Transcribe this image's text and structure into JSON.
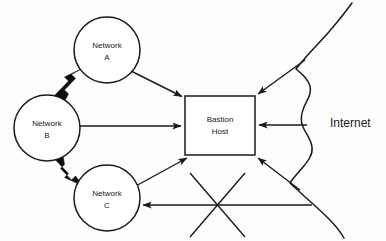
{
  "diagram": {
    "background_color": "#fdfdfd",
    "line_color": "#1a1a1a",
    "nodes": [
      {
        "id": "network-a",
        "label_line1": "Network",
        "label_line2": "A",
        "shape": "circle",
        "cx": 107,
        "cy": 50,
        "r": 33
      },
      {
        "id": "network-b",
        "label_line1": "Network",
        "label_line2": "B",
        "shape": "circle",
        "cx": 47,
        "cy": 128,
        "r": 33
      },
      {
        "id": "network-c",
        "label_line1": "Network",
        "label_line2": "C",
        "shape": "circle",
        "cx": 107,
        "cy": 198,
        "r": 33
      },
      {
        "id": "bastion-host",
        "label_line1": "Bastion",
        "label_line2": "Host",
        "shape": "rect",
        "x": 185,
        "y": 96,
        "w": 70,
        "h": 59
      }
    ],
    "cloud": {
      "id": "internet",
      "label": "Internet",
      "label_x": 330,
      "label_y": 124
    },
    "connections": [
      {
        "id": "a-to-bastion",
        "from": "network-a",
        "to": "bastion-host",
        "style": "thin-arrow",
        "direction": "one-way"
      },
      {
        "id": "b-to-bastion",
        "from": "network-b",
        "to": "bastion-host",
        "style": "thin-arrow",
        "direction": "one-way"
      },
      {
        "id": "c-to-bastion",
        "from": "network-c",
        "to": "bastion-host",
        "style": "thin-arrow",
        "direction": "one-way"
      },
      {
        "id": "a-to-b",
        "from": "network-a",
        "to": "network-b",
        "style": "thick-arrow",
        "direction": "two-way"
      },
      {
        "id": "b-to-c",
        "from": "network-b",
        "to": "network-c",
        "style": "thick-arrow",
        "direction": "two-way"
      },
      {
        "id": "internet-to-bastion-top",
        "from": "internet",
        "to": "bastion-host",
        "style": "thin-arrow",
        "direction": "one-way"
      },
      {
        "id": "internet-to-bastion-middle",
        "from": "internet",
        "to": "bastion-host",
        "style": "thin-arrow",
        "direction": "one-way"
      },
      {
        "id": "internet-to-bastion-bottom",
        "from": "internet",
        "to": "bastion-host",
        "style": "thin-arrow",
        "direction": "one-way"
      },
      {
        "id": "internet-to-c-blocked",
        "from": "internet",
        "to": "network-c",
        "style": "thin-arrow",
        "direction": "one-way",
        "annotation": "crossed-out"
      }
    ],
    "blocked_marker": {
      "id": "blocked-cross",
      "cx": 217,
      "cy": 205,
      "size": 48
    }
  }
}
